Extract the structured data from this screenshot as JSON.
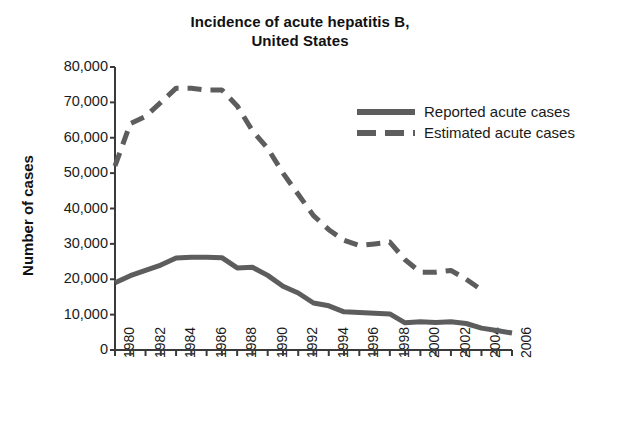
{
  "chart_data": {
    "type": "line",
    "title": "Incidence of acute hepatitis B, United States",
    "title_line1": "Incidence of acute hepatitis B,",
    "title_line2": "United States",
    "xlabel": "",
    "ylabel": "Number of cases",
    "ylim": [
      0,
      80000
    ],
    "xlim": [
      1980,
      2006
    ],
    "grid": false,
    "legend_position": "upper-right-inside",
    "ytick_labels": [
      "80,000",
      "70,000",
      "60,000",
      "50,000",
      "40,000",
      "30,000",
      "20,000",
      "10,000",
      "0"
    ],
    "ytick_values": [
      80000,
      70000,
      60000,
      50000,
      40000,
      30000,
      20000,
      10000,
      0
    ],
    "xtick_labels": [
      "1980",
      "1982",
      "1984",
      "1986",
      "1988",
      "1990",
      "1992",
      "1994",
      "1996",
      "1998",
      "2000",
      "2002",
      "2004",
      "2006"
    ],
    "xtick_values": [
      1980,
      1982,
      1984,
      1986,
      1988,
      1990,
      1992,
      1994,
      1996,
      1998,
      2000,
      2002,
      2004,
      2006
    ],
    "x": [
      1980,
      1981,
      1982,
      1983,
      1984,
      1985,
      1986,
      1987,
      1988,
      1989,
      1990,
      1991,
      1992,
      1993,
      1994,
      1995,
      1996,
      1997,
      1998,
      1999,
      2000,
      2001,
      2002,
      2003,
      2004,
      2005,
      2006
    ],
    "series": [
      {
        "name": "Reported acute cases",
        "style": "solid",
        "color": "#5d5d5d",
        "values": [
          19000,
          21000,
          22500,
          24000,
          26000,
          26200,
          26200,
          26100,
          23200,
          23400,
          21100,
          18000,
          16100,
          13300,
          12500,
          10800,
          10600,
          10400,
          10200,
          7700,
          8000,
          7800,
          8000,
          7500,
          6200,
          5500,
          4800
        ]
      },
      {
        "name": "Estimated acute cases",
        "style": "dashed",
        "color": "#5d5d5d",
        "values": [
          52000,
          64000,
          66000,
          70000,
          74000,
          74000,
          73500,
          73500,
          69000,
          62000,
          57000,
          50000,
          44000,
          38000,
          34000,
          31000,
          29500,
          30000,
          30500,
          25500,
          22000,
          22000,
          22500,
          20000,
          17000,
          null,
          null
        ]
      }
    ]
  },
  "legend": {
    "items": [
      {
        "label": "Reported acute cases",
        "style": "solid"
      },
      {
        "label": "Estimated acute cases",
        "style": "dashed"
      }
    ]
  },
  "colors": {
    "line": "#5d5d5d",
    "axis": "#3a3a3a",
    "text": "#1a1a1a",
    "background": "#ffffff"
  }
}
